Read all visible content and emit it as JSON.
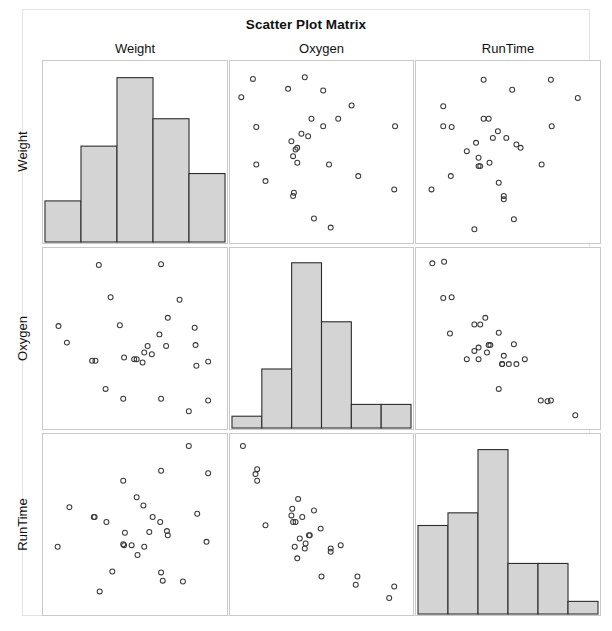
{
  "chart_data": {
    "type": "scatter",
    "title": "Scatter Plot Matrix",
    "variables": [
      "Weight",
      "Oxygen",
      "RunTime"
    ],
    "column_headers": [
      "Weight",
      "Oxygen",
      "RunTime"
    ],
    "row_headers": [
      "Weight",
      "Oxygen",
      "RunTime"
    ],
    "grid": false,
    "legend": "none",
    "n_points": 31,
    "diagonal": "histogram",
    "marker": "open-circle",
    "marker_color": "#3a3a3a",
    "bar_fill": "#d4d4d4",
    "bar_stroke": "#2b2b2b",
    "panel_border": "#c9c9c9",
    "frame_border": "#e3e3e3",
    "histograms": [
      {
        "variable": "Weight",
        "bins": 5,
        "counts": [
          3,
          7,
          12,
          9,
          5
        ],
        "ymax": 13
      },
      {
        "variable": "Oxygen",
        "bins": 6,
        "counts": [
          1,
          5,
          14,
          9,
          2,
          2
        ],
        "ymax": 15
      },
      {
        "variable": "RunTime",
        "bins": 6,
        "counts": [
          7,
          8,
          13,
          4,
          4,
          1
        ],
        "ymax": 14
      }
    ],
    "panels": [
      {
        "row": "Weight",
        "col": "Weight",
        "kind": "histogram",
        "hist_index": 0
      },
      {
        "row": "Weight",
        "col": "Oxygen",
        "kind": "scatter",
        "xlabel": "Oxygen",
        "ylabel": "Weight",
        "points": [
          [
            0.09,
            0.94
          ],
          [
            0.4,
            0.95
          ],
          [
            0.3,
            0.88
          ],
          [
            0.02,
            0.83
          ],
          [
            0.51,
            0.87
          ],
          [
            0.68,
            0.78
          ],
          [
            0.11,
            0.65
          ],
          [
            0.44,
            0.7
          ],
          [
            0.6,
            0.7
          ],
          [
            0.51,
            0.655
          ],
          [
            0.94,
            0.655
          ],
          [
            0.38,
            0.61
          ],
          [
            0.42,
            0.595
          ],
          [
            0.32,
            0.565
          ],
          [
            0.355,
            0.525
          ],
          [
            0.345,
            0.515
          ],
          [
            0.33,
            0.475
          ],
          [
            0.355,
            0.435
          ],
          [
            0.11,
            0.425
          ],
          [
            0.545,
            0.425
          ],
          [
            0.72,
            0.355
          ],
          [
            0.165,
            0.325
          ],
          [
            0.935,
            0.275
          ],
          [
            0.335,
            0.255
          ],
          [
            0.33,
            0.235
          ],
          [
            0.455,
            0.1
          ],
          [
            0.555,
            0.045
          ]
        ]
      },
      {
        "row": "Weight",
        "col": "RunTime",
        "kind": "scatter",
        "xlabel": "RunTime",
        "ylabel": "Weight",
        "points": [
          [
            0.355,
            0.935
          ],
          [
            0.755,
            0.935
          ],
          [
            0.525,
            0.875
          ],
          [
            0.915,
            0.825
          ],
          [
            0.115,
            0.775
          ],
          [
            0.355,
            0.7
          ],
          [
            0.385,
            0.7
          ],
          [
            0.115,
            0.655
          ],
          [
            0.165,
            0.65
          ],
          [
            0.76,
            0.655
          ],
          [
            0.44,
            0.625
          ],
          [
            0.41,
            0.585
          ],
          [
            0.49,
            0.585
          ],
          [
            0.31,
            0.555
          ],
          [
            0.55,
            0.545
          ],
          [
            0.575,
            0.525
          ],
          [
            0.255,
            0.505
          ],
          [
            0.325,
            0.465
          ],
          [
            0.39,
            0.435
          ],
          [
            0.7,
            0.425
          ],
          [
            0.325,
            0.415
          ],
          [
            0.335,
            0.415
          ],
          [
            0.16,
            0.355
          ],
          [
            0.045,
            0.275
          ],
          [
            0.445,
            0.315
          ],
          [
            0.475,
            0.235
          ],
          [
            0.475,
            0.215
          ],
          [
            0.535,
            0.095
          ],
          [
            0.3,
            0.035
          ]
        ]
      },
      {
        "row": "Oxygen",
        "col": "Weight",
        "kind": "scatter",
        "xlabel": "Weight",
        "ylabel": "Oxygen",
        "points": [
          [
            0.285,
            0.945
          ],
          [
            0.655,
            0.95
          ],
          [
            0.355,
            0.75
          ],
          [
            0.765,
            0.735
          ],
          [
            0.695,
            0.625
          ],
          [
            0.41,
            0.58
          ],
          [
            0.045,
            0.575
          ],
          [
            0.855,
            0.565
          ],
          [
            0.645,
            0.525
          ],
          [
            0.86,
            0.46
          ],
          [
            0.095,
            0.475
          ],
          [
            0.575,
            0.455
          ],
          [
            0.685,
            0.455
          ],
          [
            0.555,
            0.415
          ],
          [
            0.6,
            0.405
          ],
          [
            0.435,
            0.385
          ],
          [
            0.495,
            0.375
          ],
          [
            0.51,
            0.375
          ],
          [
            0.245,
            0.365
          ],
          [
            0.265,
            0.365
          ],
          [
            0.545,
            0.355
          ],
          [
            0.935,
            0.36
          ],
          [
            0.865,
            0.335
          ],
          [
            0.325,
            0.195
          ],
          [
            0.43,
            0.135
          ],
          [
            0.655,
            0.135
          ],
          [
            0.935,
            0.125
          ],
          [
            0.82,
            0.06
          ]
        ]
      },
      {
        "row": "Oxygen",
        "col": "Oxygen",
        "kind": "histogram",
        "hist_index": 1
      },
      {
        "row": "Oxygen",
        "col": "RunTime",
        "kind": "scatter",
        "xlabel": "RunTime",
        "ylabel": "Oxygen",
        "points": [
          [
            0.05,
            0.955
          ],
          [
            0.12,
            0.965
          ],
          [
            0.115,
            0.745
          ],
          [
            0.165,
            0.75
          ],
          [
            0.365,
            0.625
          ],
          [
            0.3,
            0.585
          ],
          [
            0.335,
            0.585
          ],
          [
            0.155,
            0.53
          ],
          [
            0.445,
            0.535
          ],
          [
            0.385,
            0.46
          ],
          [
            0.395,
            0.46
          ],
          [
            0.325,
            0.445
          ],
          [
            0.3,
            0.425
          ],
          [
            0.535,
            0.465
          ],
          [
            0.375,
            0.415
          ],
          [
            0.475,
            0.395
          ],
          [
            0.255,
            0.375
          ],
          [
            0.325,
            0.375
          ],
          [
            0.6,
            0.375
          ],
          [
            0.465,
            0.345
          ],
          [
            0.465,
            0.345
          ],
          [
            0.505,
            0.345
          ],
          [
            0.55,
            0.345
          ],
          [
            0.445,
            0.195
          ],
          [
            0.695,
            0.125
          ],
          [
            0.735,
            0.12
          ],
          [
            0.755,
            0.125
          ],
          [
            0.9,
            0.035
          ]
        ]
      },
      {
        "row": "RunTime",
        "col": "Weight",
        "kind": "scatter",
        "xlabel": "Weight",
        "ylabel": "RunTime",
        "points": [
          [
            0.82,
            0.975
          ],
          [
            0.655,
            0.825
          ],
          [
            0.935,
            0.81
          ],
          [
            0.43,
            0.765
          ],
          [
            0.51,
            0.665
          ],
          [
            0.55,
            0.615
          ],
          [
            0.11,
            0.605
          ],
          [
            0.255,
            0.545
          ],
          [
            0.26,
            0.545
          ],
          [
            0.605,
            0.545
          ],
          [
            0.87,
            0.565
          ],
          [
            0.33,
            0.515
          ],
          [
            0.65,
            0.515
          ],
          [
            0.44,
            0.45
          ],
          [
            0.585,
            0.455
          ],
          [
            0.69,
            0.46
          ],
          [
            0.695,
            0.435
          ],
          [
            0.43,
            0.38
          ],
          [
            0.435,
            0.375
          ],
          [
            0.48,
            0.375
          ],
          [
            0.925,
            0.395
          ],
          [
            0.555,
            0.365
          ],
          [
            0.04,
            0.365
          ],
          [
            0.515,
            0.315
          ],
          [
            0.365,
            0.215
          ],
          [
            0.655,
            0.21
          ],
          [
            0.665,
            0.16
          ],
          [
            0.785,
            0.155
          ],
          [
            0.29,
            0.095
          ]
        ]
      },
      {
        "row": "RunTime",
        "col": "Oxygen",
        "kind": "scatter",
        "xlabel": "Oxygen",
        "ylabel": "RunTime",
        "points": [
          [
            0.03,
            0.975
          ],
          [
            0.115,
            0.835
          ],
          [
            0.105,
            0.805
          ],
          [
            0.115,
            0.765
          ],
          [
            0.36,
            0.655
          ],
          [
            0.325,
            0.595
          ],
          [
            0.455,
            0.585
          ],
          [
            0.32,
            0.555
          ],
          [
            0.385,
            0.545
          ],
          [
            0.33,
            0.515
          ],
          [
            0.345,
            0.515
          ],
          [
            0.165,
            0.495
          ],
          [
            0.495,
            0.475
          ],
          [
            0.425,
            0.435
          ],
          [
            0.43,
            0.435
          ],
          [
            0.37,
            0.415
          ],
          [
            0.405,
            0.385
          ],
          [
            0.34,
            0.365
          ],
          [
            0.4,
            0.355
          ],
          [
            0.615,
            0.375
          ],
          [
            0.555,
            0.355
          ],
          [
            0.555,
            0.335
          ],
          [
            0.355,
            0.295
          ],
          [
            0.5,
            0.185
          ],
          [
            0.715,
            0.185
          ],
          [
            0.705,
            0.135
          ],
          [
            0.935,
            0.125
          ],
          [
            0.905,
            0.055
          ]
        ]
      },
      {
        "row": "RunTime",
        "col": "RunTime",
        "kind": "histogram",
        "hist_index": 2
      }
    ]
  },
  "layout": {
    "cells": [
      {
        "x": 0,
        "y": 0,
        "w": 186,
        "h": 184
      },
      {
        "x": 187,
        "y": 0,
        "w": 185,
        "h": 184
      },
      {
        "x": 373,
        "y": 0,
        "w": 186,
        "h": 184
      },
      {
        "x": 0,
        "y": 187,
        "w": 186,
        "h": 183
      },
      {
        "x": 187,
        "y": 187,
        "w": 185,
        "h": 183
      },
      {
        "x": 373,
        "y": 187,
        "w": 186,
        "h": 183
      },
      {
        "x": 0,
        "y": 373,
        "w": 186,
        "h": 183
      },
      {
        "x": 187,
        "y": 373,
        "w": 185,
        "h": 183
      },
      {
        "x": 373,
        "y": 373,
        "w": 186,
        "h": 183
      }
    ]
  }
}
